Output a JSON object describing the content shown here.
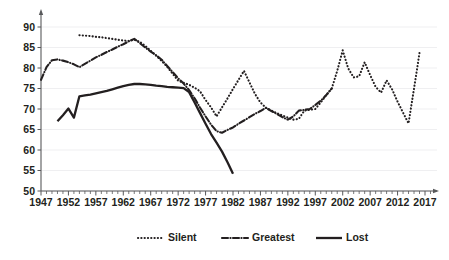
{
  "chart_data": {
    "type": "line",
    "title": "",
    "subtitle": "",
    "xlabel": "",
    "ylabel": "",
    "xlim": [
      1947,
      2019
    ],
    "ylim": [
      50,
      93
    ],
    "yticks": [
      50,
      55,
      60,
      65,
      70,
      75,
      80,
      85,
      90
    ],
    "xticks": [
      1947,
      1952,
      1957,
      1962,
      1967,
      1972,
      1977,
      1982,
      1987,
      1992,
      1997,
      2002,
      2007,
      2012,
      2017
    ],
    "xtick_step": 5,
    "minor_tick_step": 1,
    "grid": "horizontal",
    "legend_position": "bottom",
    "series": [
      {
        "name": "Silent",
        "style": "dotted",
        "color": "#231f20",
        "x": [
          1954,
          1955,
          1956,
          1957,
          1958,
          1959,
          1960,
          1961,
          1962,
          1963,
          1964,
          1965,
          1966,
          1967,
          1968,
          1969,
          1970,
          1971,
          1972,
          1973,
          1974,
          1975,
          1976,
          1977,
          1978,
          1979,
          1980,
          1981,
          1982,
          1983,
          1984,
          1985,
          1986,
          1987,
          1988,
          1989,
          1990,
          1991,
          1992,
          1993,
          1994,
          1995,
          1996,
          1997,
          1998,
          1999,
          2000,
          2001,
          2002,
          2003,
          2004,
          2005,
          2006,
          2007,
          2008,
          2009,
          2010,
          2011,
          2012,
          2013,
          2014,
          2015,
          2016
        ],
        "y": [
          88.0,
          87.9,
          87.8,
          87.6,
          87.5,
          87.3,
          87.1,
          86.9,
          86.7,
          86.6,
          86.9,
          86.4,
          85.4,
          84.2,
          83.0,
          81.7,
          80.3,
          78.6,
          76.9,
          76.4,
          75.9,
          75.2,
          74.3,
          72.2,
          70.4,
          68.2,
          70.4,
          72.6,
          74.9,
          77.1,
          79.3,
          76.5,
          73.7,
          71.6,
          70.3,
          69.6,
          69.0,
          68.4,
          67.9,
          67.4,
          67.6,
          69.6,
          69.8,
          70.0,
          71.6,
          73.4,
          75.0,
          79.3,
          84.3,
          79.9,
          77.7,
          78.0,
          81.4,
          78.3,
          75.4,
          74.0,
          77.0,
          74.8,
          71.8,
          69.1,
          66.5,
          75.0,
          83.7
        ]
      },
      {
        "name": "Greatest",
        "style": "dash-dot",
        "color": "#231f20",
        "x": [
          1947,
          1948,
          1949,
          1950,
          1951,
          1952,
          1953,
          1954,
          1955,
          1956,
          1957,
          1958,
          1959,
          1960,
          1961,
          1962,
          1963,
          1964,
          1965,
          1966,
          1967,
          1968,
          1969,
          1970,
          1971,
          1972,
          1973,
          1974,
          1975,
          1976,
          1977,
          1978,
          1979,
          1980,
          1981,
          1982,
          1983,
          1984,
          1985,
          1986,
          1987,
          1988,
          1989,
          1990,
          1991,
          1992,
          1993,
          1994,
          1995,
          1996,
          1997,
          1998,
          1999,
          2000
        ],
        "y": [
          77.1,
          80.2,
          81.9,
          82.1,
          81.8,
          81.4,
          80.9,
          80.2,
          81.0,
          81.8,
          82.6,
          83.2,
          83.9,
          84.5,
          85.2,
          85.8,
          86.5,
          87.1,
          86.1,
          85.0,
          84.0,
          83.1,
          82.0,
          80.5,
          79.0,
          77.5,
          76.2,
          74.6,
          72.6,
          70.3,
          68.2,
          66.2,
          64.6,
          64.2,
          64.9,
          65.5,
          66.4,
          67.2,
          68.0,
          68.8,
          69.5,
          70.3,
          69.5,
          68.8,
          68.0,
          67.4,
          68.2,
          69.6,
          69.8,
          70.0,
          71.0,
          72.0,
          73.4,
          75.0
        ]
      },
      {
        "name": "Lost",
        "style": "solid",
        "color": "#231f20",
        "x": [
          1950,
          1951,
          1952,
          1953,
          1954,
          1955,
          1956,
          1957,
          1958,
          1959,
          1960,
          1961,
          1962,
          1963,
          1964,
          1965,
          1966,
          1967,
          1968,
          1969,
          1970,
          1971,
          1972,
          1973,
          1974,
          1975,
          1976,
          1977,
          1978,
          1979,
          1980,
          1981,
          1982
        ],
        "y": [
          67.0,
          68.5,
          70.1,
          67.9,
          73.1,
          73.3,
          73.5,
          73.8,
          74.1,
          74.4,
          74.8,
          75.2,
          75.6,
          75.9,
          76.1,
          76.1,
          76.0,
          75.9,
          75.7,
          75.6,
          75.4,
          75.3,
          75.2,
          75.1,
          74.1,
          71.6,
          69.0,
          66.4,
          63.9,
          61.8,
          59.6,
          57.0,
          54.2
        ]
      }
    ]
  },
  "legend": {
    "items": [
      {
        "label": "Silent",
        "style": "dotted"
      },
      {
        "label": "Greatest",
        "style": "dash-dot"
      },
      {
        "label": "Lost",
        "style": "solid"
      }
    ]
  },
  "axes": {
    "y_tick_labels": [
      "90",
      "85",
      "80",
      "75",
      "70",
      "65",
      "60",
      "55",
      "50"
    ],
    "x_tick_labels": [
      "1947",
      "1952",
      "1957",
      "1962",
      "1967",
      "1972",
      "1977",
      "1982",
      "1987",
      "1992",
      "1997",
      "2002",
      "2007",
      "2012",
      "2017"
    ]
  }
}
